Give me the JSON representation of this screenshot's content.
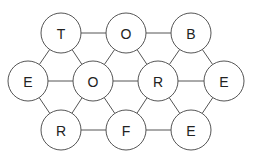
{
  "diagram": {
    "type": "letter-grid-graph",
    "nodes": [
      {
        "id": "n1",
        "label": "T",
        "x": 61,
        "y": 33
      },
      {
        "id": "n2",
        "label": "O",
        "x": 126,
        "y": 33
      },
      {
        "id": "n3",
        "label": "B",
        "x": 191,
        "y": 33
      },
      {
        "id": "n4",
        "label": "E",
        "x": 28,
        "y": 81
      },
      {
        "id": "n5",
        "label": "O",
        "x": 93,
        "y": 81
      },
      {
        "id": "n6",
        "label": "R",
        "x": 158,
        "y": 81
      },
      {
        "id": "n7",
        "label": "E",
        "x": 224,
        "y": 81
      },
      {
        "id": "n8",
        "label": "R",
        "x": 61,
        "y": 130
      },
      {
        "id": "n9",
        "label": "F",
        "x": 126,
        "y": 130
      },
      {
        "id": "n10",
        "label": "E",
        "x": 191,
        "y": 130
      }
    ],
    "edges": [
      [
        "n1",
        "n2"
      ],
      [
        "n2",
        "n3"
      ],
      [
        "n4",
        "n5"
      ],
      [
        "n5",
        "n6"
      ],
      [
        "n6",
        "n7"
      ],
      [
        "n8",
        "n9"
      ],
      [
        "n9",
        "n10"
      ],
      [
        "n1",
        "n4"
      ],
      [
        "n1",
        "n5"
      ],
      [
        "n2",
        "n5"
      ],
      [
        "n2",
        "n6"
      ],
      [
        "n3",
        "n6"
      ],
      [
        "n3",
        "n7"
      ],
      [
        "n8",
        "n4"
      ],
      [
        "n8",
        "n5"
      ],
      [
        "n9",
        "n5"
      ],
      [
        "n9",
        "n6"
      ],
      [
        "n10",
        "n6"
      ],
      [
        "n10",
        "n7"
      ]
    ],
    "node_radius": 20,
    "colors": {
      "stroke": "#555555",
      "fill": "#ffffff",
      "text": "#222222"
    }
  }
}
